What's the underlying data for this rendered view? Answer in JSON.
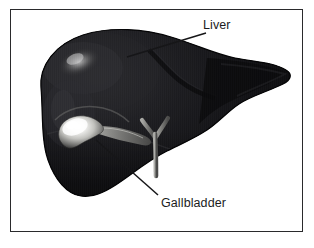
{
  "figure": {
    "type": "anatomical-illustration",
    "frame_color": "#2a2a2c",
    "background_color": "#ffffff",
    "organ_color": "#121214",
    "highlight_color": "#f2f2f0",
    "duct_color": "#5a5a5c",
    "leader_line_color": "#161618",
    "labels": [
      {
        "id": "liver",
        "text": "Liver",
        "x": 202,
        "y": 18,
        "leader_from": [
          205,
          32
        ],
        "leader_to": [
          126,
          56
        ]
      },
      {
        "id": "gallbladder",
        "text": "Gallbladder",
        "x": 160,
        "y": 196,
        "leader_from": [
          157,
          194
        ],
        "leader_to": [
          95,
          139
        ]
      }
    ],
    "structures": [
      {
        "name": "liver-right-lobe",
        "description": "large rounded lobe at left"
      },
      {
        "name": "liver-left-lobe",
        "description": "tapering pointed lobe at right"
      },
      {
        "name": "gallbladder",
        "description": "bright pear-shaped sac under the liver"
      },
      {
        "name": "cystic-duct",
        "description": "gray duct from gallbladder neck"
      },
      {
        "name": "common-bile-duct",
        "description": "Y-shaped branching duct"
      }
    ]
  }
}
